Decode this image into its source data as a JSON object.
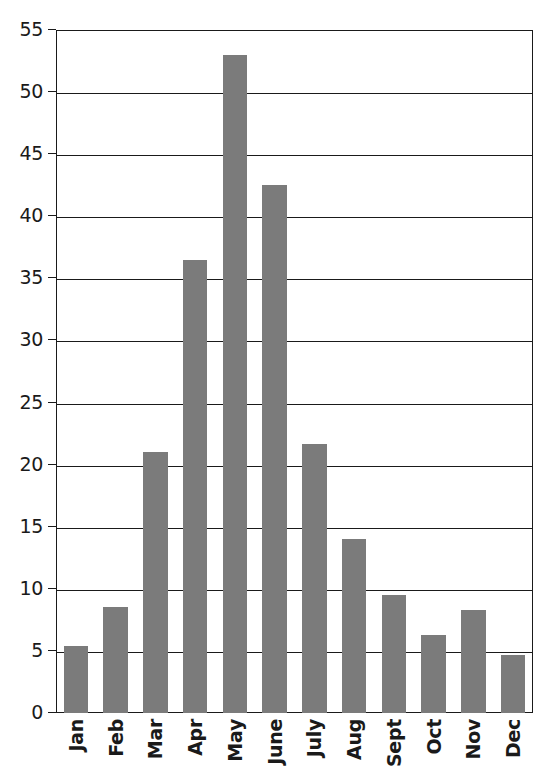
{
  "chart_data": {
    "type": "bar",
    "title": "",
    "subtitle": "",
    "xlabel": "",
    "ylabel": "",
    "categories": [
      "Jan",
      "Feb",
      "Mar",
      "Apr",
      "May",
      "June",
      "July",
      "Aug",
      "Sept",
      "Oct",
      "Nov",
      "Dec"
    ],
    "values": [
      5.4,
      8.5,
      21.0,
      36.5,
      53.0,
      42.5,
      21.7,
      14.0,
      9.5,
      6.3,
      8.3,
      4.7
    ],
    "series": [
      {
        "name": "Monthly value",
        "values": [
          5.4,
          8.5,
          21.0,
          36.5,
          53.0,
          42.5,
          21.7,
          14.0,
          9.5,
          6.3,
          8.3,
          4.7
        ]
      }
    ],
    "ylim": [
      0,
      55
    ],
    "yticks": [
      0,
      5,
      10,
      15,
      20,
      25,
      30,
      35,
      40,
      45,
      50,
      55
    ],
    "ytick_labels": [
      "0",
      "5",
      "10",
      "15",
      "20",
      "25",
      "30",
      "35",
      "40",
      "45",
      "50",
      "55"
    ],
    "grid": "horizontal",
    "legend": "none",
    "annotations": [],
    "colors": {
      "bar_fill": "#7b7b7b",
      "axis": "#1a1a1a",
      "gridline": "#1a1a1a",
      "background": "#ffffff"
    }
  }
}
